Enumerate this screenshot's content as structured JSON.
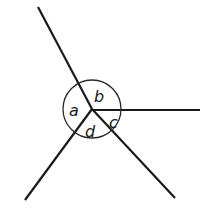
{
  "diagram": {
    "type": "angles-at-a-point",
    "center": [
      92,
      109
    ],
    "circle_radius": 29,
    "rays": [
      {
        "name": "ray-upper-left",
        "end": [
          38,
          7
        ]
      },
      {
        "name": "ray-right",
        "end": [
          200,
          110
        ]
      },
      {
        "name": "ray-lower-right",
        "end": [
          175,
          198
        ]
      },
      {
        "name": "ray-lower-left",
        "end": [
          25,
          200
        ]
      }
    ],
    "labels": {
      "a": "a",
      "b": "b",
      "c": "c",
      "d": "d"
    },
    "colors": {
      "line": "#1a1a1a",
      "background": "#ffffff"
    }
  }
}
